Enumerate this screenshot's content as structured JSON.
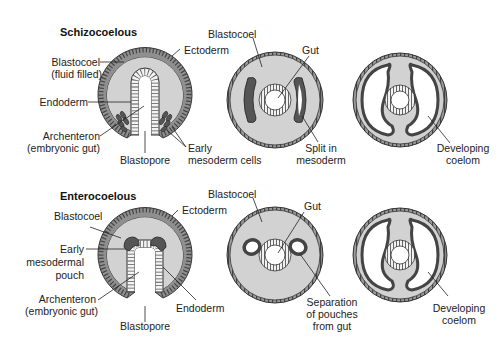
{
  "colors": {
    "fill": "#d2d2d2",
    "ectoderm": "#8a8a8a",
    "mesoderm": "#5a5a5a",
    "outline": "#333333",
    "background": "#ffffff"
  },
  "schizocoelous": {
    "title": "Schizocoelous",
    "gastrula": {
      "blastocoel": "Blastocoel",
      "blastocoel_note": "(fluid filled)",
      "ectoderm": "Ectoderm",
      "endoderm": "Endoderm",
      "archenteron": "Archenteron",
      "archenteron_note": "(embryonic gut)",
      "blastopore": "Blastopore",
      "early": "Early",
      "mesoderm_cells": "mesoderm cells"
    },
    "stage2": {
      "blastocoel": "Blastocoel",
      "gut": "Gut",
      "split_in": "Split in",
      "mesoderm": "mesoderm"
    },
    "stage3": {
      "developing": "Developing",
      "coelom": "coelom"
    }
  },
  "enterocoelous": {
    "title": "Enterocoelous",
    "gastrula": {
      "blastocoel": "Blastocoel",
      "ectoderm": "Ectoderm",
      "early": "Early",
      "mesodermal": "mesodermal",
      "pouch": "pouch",
      "archenteron": "Archenteron",
      "archenteron_note": "(embryonic gut)",
      "blastopore": "Blastopore",
      "endoderm": "Endoderm"
    },
    "stage2": {
      "blastocoel": "Blastocoel",
      "gut": "Gut",
      "separation": "Separation",
      "of_pouches": "of pouches",
      "from_gut": "from gut"
    },
    "stage3": {
      "developing": "Developing",
      "coelom": "coelom"
    }
  }
}
